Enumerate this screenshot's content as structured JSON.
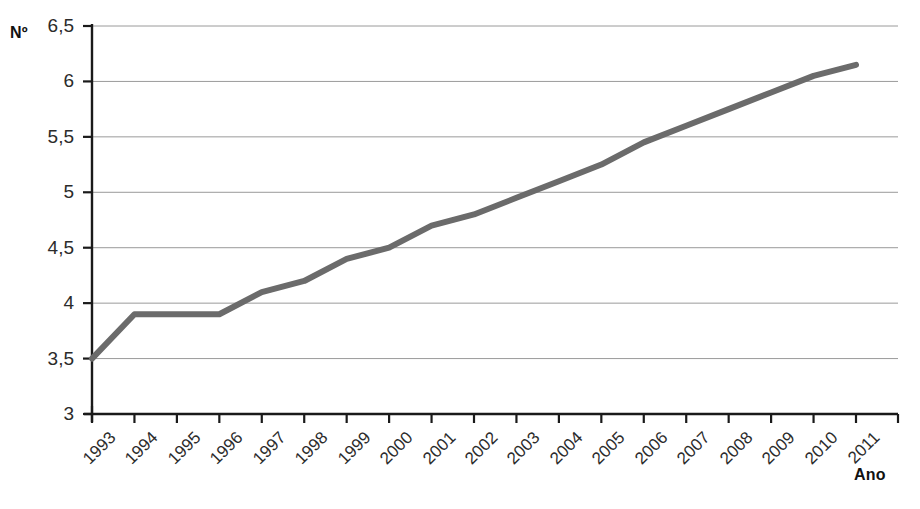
{
  "chart_data": {
    "type": "line",
    "title": "",
    "subtitle": "",
    "xlabel": "Ano",
    "ylabel": "Nº",
    "x": [
      1993,
      1994,
      1995,
      1996,
      1997,
      1998,
      1999,
      2000,
      2001,
      2002,
      2003,
      2004,
      2005,
      2006,
      2007,
      2008,
      2009,
      2010,
      2011
    ],
    "categories": [
      "1993",
      "1994",
      "1995",
      "1996",
      "1997",
      "1998",
      "1999",
      "2000",
      "2001",
      "2002",
      "2003",
      "2004",
      "2005",
      "2006",
      "2007",
      "2008",
      "2009",
      "2010",
      "2011"
    ],
    "values": [
      3.5,
      3.9,
      3.9,
      3.9,
      4.1,
      4.2,
      4.4,
      4.5,
      4.7,
      4.8,
      4.95,
      5.1,
      5.25,
      5.45,
      5.6,
      5.75,
      5.9,
      6.05,
      6.15
    ],
    "series": [
      {
        "name": "",
        "color": "#6b6b6b",
        "values": [
          3.5,
          3.9,
          3.9,
          3.9,
          4.1,
          4.2,
          4.4,
          4.5,
          4.7,
          4.8,
          4.95,
          5.1,
          5.25,
          5.45,
          5.6,
          5.75,
          5.9,
          6.05,
          6.15
        ]
      }
    ],
    "ylim": [
      3,
      6.5
    ],
    "ytick_values": [
      3,
      3.5,
      4,
      4.5,
      5,
      5.5,
      6,
      6.5
    ],
    "ytick_labels": [
      "3",
      "3,5",
      "4",
      "4,5",
      "5",
      "5,5",
      "6",
      "6,5"
    ],
    "grid": true,
    "grid_axis": "y",
    "legend": false,
    "legend_position": "none",
    "annotations": []
  },
  "axis_titles": {
    "y": "Nº",
    "x": "Ano"
  },
  "colors": {
    "line": "#6b6b6b",
    "axis": "#1a1a1a",
    "grid": "#9a9a9a",
    "text": "#2b2b2b",
    "background": "#ffffff"
  }
}
